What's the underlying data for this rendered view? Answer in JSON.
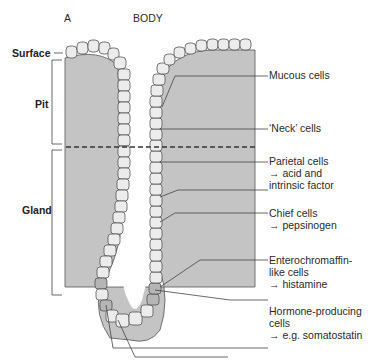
{
  "header": {
    "panel_letter": "A",
    "region": "BODY"
  },
  "zones": [
    {
      "id": "surface",
      "label": "Surface"
    },
    {
      "id": "pit",
      "label": "Pit"
    },
    {
      "id": "gland",
      "label": "Gland"
    }
  ],
  "annotations": [
    {
      "id": "mucous",
      "lines": [
        "Mucous cells"
      ]
    },
    {
      "id": "neck",
      "lines": [
        "‘Neck’ cells"
      ]
    },
    {
      "id": "parietal",
      "lines": [
        "Parietal cells",
        "→ acid and",
        "intrinsic factor"
      ]
    },
    {
      "id": "chief",
      "lines": [
        "Chief cells",
        "→ pepsinogen"
      ]
    },
    {
      "id": "ecl",
      "lines": [
        "Enterochromaffin-",
        "like cells",
        "→ histamine"
      ]
    },
    {
      "id": "hormone",
      "lines": [
        "Hormone-producing",
        "cells",
        "→ e.g. somatostatin"
      ]
    }
  ],
  "colors": {
    "tissue_gray": "#c4c4c4",
    "cell_fill": "#ececec",
    "special_cell_fill": "#b5b5b5",
    "line": "#3a3a3a"
  }
}
